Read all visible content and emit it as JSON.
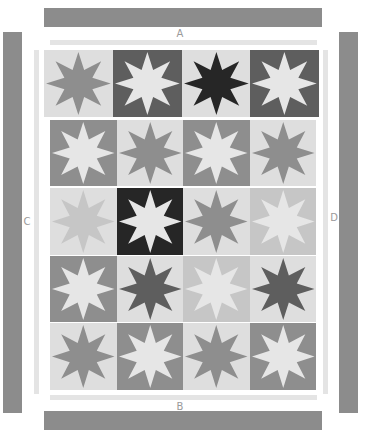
{
  "diagram": {
    "colors": {
      "light": "#dedede",
      "pale": "#c6c6c6",
      "medium": "#8e8e8e",
      "dark": "#5e5e5e",
      "black": "#262626",
      "star_light": "#e6e6e6",
      "border_bar": "#8c8c8c",
      "border_strip": "#e4e4e4",
      "label": "#9a9a9a"
    },
    "borders": {
      "top": {
        "label": "A"
      },
      "bottom": {
        "label": "B"
      },
      "left": {
        "label": "C"
      },
      "right": {
        "label": "D"
      }
    },
    "rows": [
      {
        "blocks": [
          {
            "bg": "light",
            "star": "medium"
          },
          {
            "bg": "dark",
            "star": "star_light"
          },
          {
            "bg": "light",
            "star": "black"
          },
          {
            "bg": "dark",
            "star": "star_light"
          }
        ]
      },
      {
        "blocks": [
          {
            "bg": "medium",
            "star": "star_light"
          },
          {
            "bg": "light",
            "star": "medium"
          },
          {
            "bg": "medium",
            "star": "star_light"
          },
          {
            "bg": "light",
            "star": "medium"
          }
        ]
      },
      {
        "blocks": [
          {
            "bg": "light",
            "star": "pale"
          },
          {
            "bg": "black",
            "star": "star_light"
          },
          {
            "bg": "light",
            "star": "medium"
          },
          {
            "bg": "pale",
            "star": "star_light"
          }
        ]
      },
      {
        "blocks": [
          {
            "bg": "medium",
            "star": "star_light"
          },
          {
            "bg": "light",
            "star": "dark"
          },
          {
            "bg": "pale",
            "star": "star_light"
          },
          {
            "bg": "light",
            "star": "dark"
          }
        ]
      },
      {
        "blocks": [
          {
            "bg": "light",
            "star": "medium"
          },
          {
            "bg": "medium",
            "star": "star_light"
          },
          {
            "bg": "light",
            "star": "medium"
          },
          {
            "bg": "medium",
            "star": "star_light"
          }
        ]
      }
    ]
  }
}
